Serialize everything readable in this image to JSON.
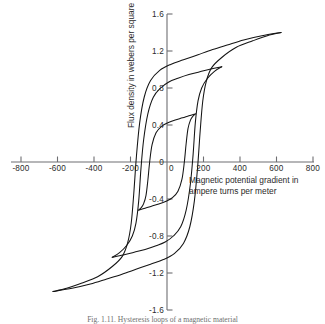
{
  "figure": {
    "caption": "Fig. 1.11.   Hysteresis loops of a magnetic material"
  },
  "chart_data": {
    "type": "line",
    "title": "",
    "xlabel": "Magnetic potential gradient in ampere turns per meter",
    "ylabel": "Flux density in webers per square meter",
    "xlim": [
      -800,
      800
    ],
    "ylim": [
      -1.6,
      1.6
    ],
    "xticks": [
      -800,
      -600,
      -400,
      -200,
      0,
      200,
      400,
      600,
      800
    ],
    "xtick_labels": [
      "-800",
      "-600",
      "-400",
      "-200",
      "0",
      "200",
      "400",
      "600",
      "800"
    ],
    "yticks": [
      1.6,
      1.2,
      0.8,
      0.4,
      0,
      -0.4,
      -0.8,
      -1.2,
      -1.6
    ],
    "ytick_labels": [
      "1.6",
      "1.2",
      "0.8",
      "0.4",
      "0",
      "-0.4",
      "-0.8",
      "-1.2",
      "-1.6"
    ],
    "grid": false,
    "legend": "none",
    "axis_style": "centered-cross",
    "series": [
      {
        "name": "outer-loop",
        "tip_positive": [
          625,
          1.4
        ],
        "tip_negative": [
          -625,
          -1.4
        ],
        "remanence": 1.03,
        "coercivity": 118,
        "descending_points": [
          [
            625,
            1.4
          ],
          [
            520,
            1.365
          ],
          [
            420,
            1.32
          ],
          [
            330,
            1.265
          ],
          [
            250,
            1.215
          ],
          [
            170,
            1.16
          ],
          [
            90,
            1.105
          ],
          [
            20,
            1.055
          ],
          [
            -40,
            0.99
          ],
          [
            -90,
            0.88
          ],
          [
            -125,
            0.7
          ],
          [
            -150,
            0.42
          ],
          [
            -168,
            0.05
          ],
          [
            -182,
            -0.34
          ],
          [
            -196,
            -0.66
          ],
          [
            -215,
            -0.87
          ],
          [
            -245,
            -1.02
          ],
          [
            -300,
            -1.13
          ],
          [
            -380,
            -1.24
          ],
          [
            -470,
            -1.31
          ],
          [
            -550,
            -1.365
          ],
          [
            -625,
            -1.4
          ]
        ],
        "ascending_points": [
          [
            -625,
            -1.4
          ],
          [
            -520,
            -1.365
          ],
          [
            -420,
            -1.32
          ],
          [
            -330,
            -1.265
          ],
          [
            -250,
            -1.215
          ],
          [
            -170,
            -1.16
          ],
          [
            -90,
            -1.105
          ],
          [
            -20,
            -1.055
          ],
          [
            40,
            -0.99
          ],
          [
            90,
            -0.88
          ],
          [
            125,
            -0.7
          ],
          [
            150,
            -0.42
          ],
          [
            168,
            -0.05
          ],
          [
            182,
            0.34
          ],
          [
            196,
            0.66
          ],
          [
            215,
            0.87
          ],
          [
            245,
            1.02
          ],
          [
            300,
            1.13
          ],
          [
            380,
            1.24
          ],
          [
            470,
            1.31
          ],
          [
            550,
            1.365
          ],
          [
            625,
            1.4
          ]
        ]
      },
      {
        "name": "middle-loop",
        "tip_positive": [
          300,
          1.03
        ],
        "tip_negative": [
          -300,
          -1.03
        ],
        "remanence": 0.8,
        "coercivity": 100,
        "descending_points": [
          [
            300,
            1.03
          ],
          [
            240,
            1.005
          ],
          [
            180,
            0.975
          ],
          [
            120,
            0.945
          ],
          [
            60,
            0.905
          ],
          [
            10,
            0.865
          ],
          [
            -35,
            0.8
          ],
          [
            -75,
            0.7
          ],
          [
            -105,
            0.52
          ],
          [
            -128,
            0.24
          ],
          [
            -143,
            -0.08
          ],
          [
            -155,
            -0.42
          ],
          [
            -170,
            -0.66
          ],
          [
            -190,
            -0.8
          ],
          [
            -220,
            -0.9
          ],
          [
            -260,
            -0.98
          ],
          [
            -300,
            -1.03
          ]
        ],
        "ascending_points": [
          [
            -300,
            -1.03
          ],
          [
            -240,
            -1.005
          ],
          [
            -180,
            -0.975
          ],
          [
            -120,
            -0.945
          ],
          [
            -60,
            -0.905
          ],
          [
            -10,
            -0.865
          ],
          [
            35,
            -0.8
          ],
          [
            75,
            -0.7
          ],
          [
            105,
            -0.52
          ],
          [
            128,
            -0.24
          ],
          [
            143,
            0.08
          ],
          [
            155,
            0.42
          ],
          [
            170,
            0.66
          ],
          [
            190,
            0.8
          ],
          [
            220,
            0.9
          ],
          [
            260,
            0.98
          ],
          [
            300,
            1.03
          ]
        ]
      },
      {
        "name": "inner-loop",
        "tip_positive": [
          155,
          0.52
        ],
        "tip_negative": [
          -155,
          -0.52
        ],
        "remanence": 0.41,
        "coercivity": 72,
        "descending_points": [
          [
            155,
            0.52
          ],
          [
            120,
            0.5
          ],
          [
            85,
            0.478
          ],
          [
            45,
            0.455
          ],
          [
            5,
            0.425
          ],
          [
            -30,
            0.385
          ],
          [
            -60,
            0.315
          ],
          [
            -82,
            0.185
          ],
          [
            -95,
            0.0
          ],
          [
            -105,
            -0.2
          ],
          [
            -115,
            -0.36
          ],
          [
            -128,
            -0.45
          ],
          [
            -142,
            -0.495
          ],
          [
            -155,
            -0.52
          ]
        ],
        "ascending_points": [
          [
            -155,
            -0.52
          ],
          [
            -120,
            -0.5
          ],
          [
            -85,
            -0.478
          ],
          [
            -45,
            -0.455
          ],
          [
            -5,
            -0.425
          ],
          [
            30,
            -0.385
          ],
          [
            60,
            -0.315
          ],
          [
            82,
            -0.185
          ],
          [
            95,
            0.0
          ],
          [
            105,
            0.2
          ],
          [
            115,
            0.36
          ],
          [
            128,
            0.45
          ],
          [
            142,
            0.495
          ],
          [
            155,
            0.52
          ]
        ]
      }
    ]
  }
}
